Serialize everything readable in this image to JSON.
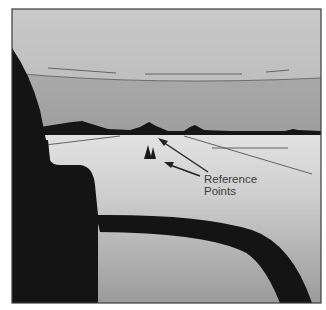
{
  "figure": {
    "label_line1": "Reference",
    "label_line2": "Points"
  },
  "colors": {
    "sky_top": "#c4c4c4",
    "sky_band_top": "#a8a8a8",
    "sky_band_bottom": "#9a9a9a",
    "ground_top": "#dedede",
    "ground_bottom": "#9c9c9c",
    "silhouette": "#141414",
    "frame": "#3c3c3c",
    "lines": "#555555"
  }
}
